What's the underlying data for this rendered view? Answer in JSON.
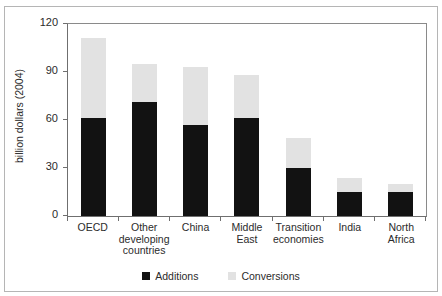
{
  "figure": {
    "cut_off_title": "",
    "frame_color": "#b5b5b5"
  },
  "chart_data": {
    "type": "bar",
    "subtype": "stacked-vertical",
    "title": "",
    "xlabel": "",
    "ylabel": "billion dollars (2004)",
    "ylim": [
      0,
      120
    ],
    "yticks": [
      0,
      30,
      60,
      90,
      120
    ],
    "ytick_labels": [
      "0",
      "30",
      "60",
      "90",
      "120"
    ],
    "grid": false,
    "legend_position": "bottom",
    "categories": [
      "OECD",
      "Other developing countries",
      "China",
      "Middle East",
      "Transition economies",
      "India",
      "North Africa"
    ],
    "category_label_lines": [
      [
        "OECD"
      ],
      [
        "Other",
        "developing",
        "countries"
      ],
      [
        "China"
      ],
      [
        "Middle",
        "East"
      ],
      [
        "Transition",
        "economies"
      ],
      [
        "India"
      ],
      [
        "North",
        "Africa"
      ]
    ],
    "series": [
      {
        "name": "Additions",
        "color": "#121212",
        "values": [
          61,
          71,
          57,
          61,
          30,
          15,
          15
        ]
      },
      {
        "name": "Conversions",
        "color": "#e2e2e2",
        "values": [
          50,
          24,
          36,
          27,
          19,
          9,
          5
        ]
      }
    ],
    "totals": [
      111,
      95,
      93,
      88,
      49,
      24,
      20
    ]
  },
  "legend": {
    "items": [
      {
        "label": "Additions",
        "color": "#121212"
      },
      {
        "label": "Conversions",
        "color": "#e2e2e2"
      }
    ]
  }
}
